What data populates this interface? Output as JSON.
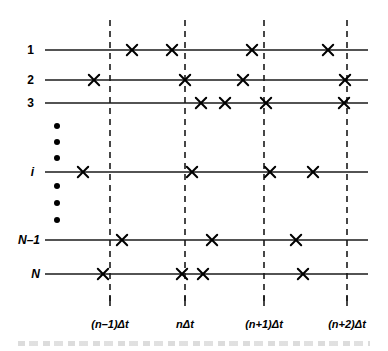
{
  "figure": {
    "width": 388,
    "height": 351,
    "colors": {
      "line": "#1a1a1a",
      "dash": "#1a1a1a",
      "marker": "#000000",
      "text": "#000000",
      "background": "#ffffff"
    }
  },
  "geometry": {
    "axis_x_start": 45,
    "axis_x_end": 368,
    "dash_y_top": 20,
    "dash_y_bottom": 302,
    "dot_column_x": 57,
    "tick_label_y": 318,
    "tick_mark_top": 296,
    "tick_mark_bottom": 306
  },
  "rows": [
    {
      "label": "1",
      "italic": false,
      "y": 50,
      "label_x": 34,
      "markers": [
        132,
        172,
        252,
        328
      ]
    },
    {
      "label": "2",
      "italic": false,
      "y": 80,
      "label_x": 34,
      "markers": [
        94,
        185,
        243,
        345
      ]
    },
    {
      "label": "3",
      "italic": false,
      "y": 103,
      "label_x": 34,
      "markers": [
        201,
        225,
        266,
        344
      ]
    },
    {
      "label": "i",
      "italic": true,
      "y": 172,
      "label_x": 34,
      "markers": [
        83,
        192,
        270,
        313
      ]
    },
    {
      "label": "N–1",
      "italic": true,
      "y": 240,
      "label_x": 40,
      "markers": [
        122,
        212,
        296
      ]
    },
    {
      "label": "N",
      "italic": true,
      "y": 274,
      "label_x": 40,
      "markers": [
        103,
        182,
        203,
        303
      ]
    }
  ],
  "ellipsis_dots": {
    "upper": [
      126,
      142,
      158
    ],
    "lower": [
      186,
      203,
      220
    ]
  },
  "time_axis": {
    "lines": [
      {
        "x": 110,
        "label": "(n–1)Δt"
      },
      {
        "x": 185,
        "label": "nΔt"
      },
      {
        "x": 264,
        "label": "(n+1)Δt"
      },
      {
        "x": 347,
        "label": "(n+2)Δt"
      }
    ]
  },
  "chart_data": {
    "type": "scatter",
    "xlabel": "time",
    "ylabel": "unit index",
    "grid": "vertical dashed lines at time steps",
    "legend": "none",
    "x_tick_labels": [
      "(n–1)Δt",
      "nΔt",
      "(n+1)Δt",
      "(n+2)Δt"
    ],
    "x_tick_positions_px": [
      110,
      185,
      264,
      347
    ],
    "y_categories": [
      "1",
      "2",
      "3",
      "i",
      "N–1",
      "N"
    ],
    "marker_symbol": "×",
    "series": [
      {
        "name": "1",
        "x_px": [
          132,
          172,
          252,
          328
        ]
      },
      {
        "name": "2",
        "x_px": [
          94,
          185,
          243,
          345
        ]
      },
      {
        "name": "3",
        "x_px": [
          201,
          225,
          266,
          344
        ]
      },
      {
        "name": "i",
        "x_px": [
          83,
          192,
          270,
          313
        ]
      },
      {
        "name": "N–1",
        "x_px": [
          122,
          212,
          296
        ]
      },
      {
        "name": "N",
        "x_px": [
          103,
          182,
          203,
          303
        ]
      }
    ]
  }
}
